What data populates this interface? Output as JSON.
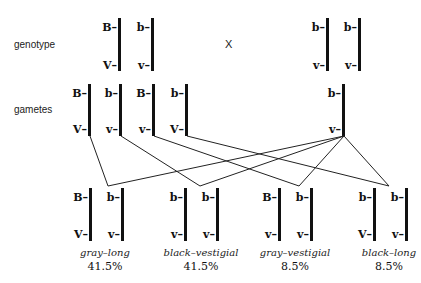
{
  "labels": {
    "genotype": "genotype",
    "gametes": "gametes",
    "cross_symbol": "X"
  },
  "parents": [
    {
      "name": "parent-1",
      "chromosomes": [
        {
          "top": "B–",
          "bottom": "V–"
        },
        {
          "top": "b–",
          "bottom": "v–"
        }
      ]
    },
    {
      "name": "parent-2",
      "chromosomes": [
        {
          "top": "b–",
          "bottom": "v–"
        },
        {
          "top": "b–",
          "bottom": "v–"
        }
      ]
    }
  ],
  "gametes": {
    "parent1": [
      {
        "top": "B–",
        "bottom": "V–"
      },
      {
        "top": "b–",
        "bottom": "v–"
      },
      {
        "top": "B–",
        "bottom": "v–"
      },
      {
        "top": "b–",
        "bottom": "V–"
      }
    ],
    "parent2": [
      {
        "top": "b–",
        "bottom": "v–"
      }
    ]
  },
  "offspring": [
    {
      "chromosomes": [
        {
          "top": "B–",
          "bottom": "V–"
        },
        {
          "top": "b–",
          "bottom": "v–"
        }
      ],
      "phenotype": "gray–long",
      "percent": "41.5%"
    },
    {
      "chromosomes": [
        {
          "top": "b–",
          "bottom": "v–"
        },
        {
          "top": "b–",
          "bottom": "v–"
        }
      ],
      "phenotype": "black–vestigial",
      "percent": "41.5%"
    },
    {
      "chromosomes": [
        {
          "top": "B–",
          "bottom": "v–"
        },
        {
          "top": "b–",
          "bottom": "v–"
        }
      ],
      "phenotype": "gray–vestigial",
      "percent": "8.5%"
    },
    {
      "chromosomes": [
        {
          "top": "b–",
          "bottom": "V–"
        },
        {
          "top": "b–",
          "bottom": "v–"
        }
      ],
      "phenotype": "black–long",
      "percent": "8.5%"
    }
  ]
}
